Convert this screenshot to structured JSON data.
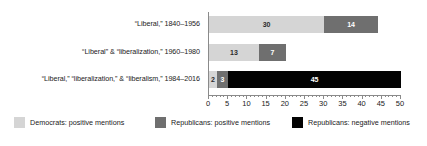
{
  "chart_data": {
    "type": "bar",
    "orientation": "horizontal",
    "stacked": true,
    "title": "",
    "xlabel": "",
    "ylabel": "",
    "xlim": [
      0,
      50
    ],
    "grid": false,
    "legend_position": "bottom",
    "categories": [
      "“Liberal,” 1840–1956",
      "“Liberal” & “liberalization,” 1960–1980",
      "“Liberal,” “liberalization,” & “liberalism,” 1984–2016"
    ],
    "series": [
      {
        "name": "Democrats: positive mentions",
        "color": "#d5d5d5",
        "values": [
          30,
          13,
          2
        ]
      },
      {
        "name": "Republicans: positive mentions",
        "color": "#6f6f6f",
        "values": [
          14,
          7,
          3
        ]
      },
      {
        "name": "Republicans: negative mentions",
        "color": "#030303",
        "values": [
          0,
          0,
          45
        ]
      }
    ],
    "xticks": [
      0,
      5,
      10,
      15,
      20,
      25,
      30,
      35,
      40,
      45,
      50
    ],
    "xtick_labels": [
      "0",
      "5",
      "10",
      "15",
      "20",
      "25",
      "30",
      "35",
      "40",
      "45",
      "50"
    ],
    "bar_labels": [
      [
        "30",
        "14",
        ""
      ],
      [
        "13",
        "7",
        ""
      ],
      [
        "2",
        "3",
        "45"
      ]
    ]
  },
  "legend": {
    "items": [
      {
        "label": "Democrats: positive mentions"
      },
      {
        "label": "Republicans: positive mentions"
      },
      {
        "label": "Republicans: negative mentions"
      }
    ]
  }
}
